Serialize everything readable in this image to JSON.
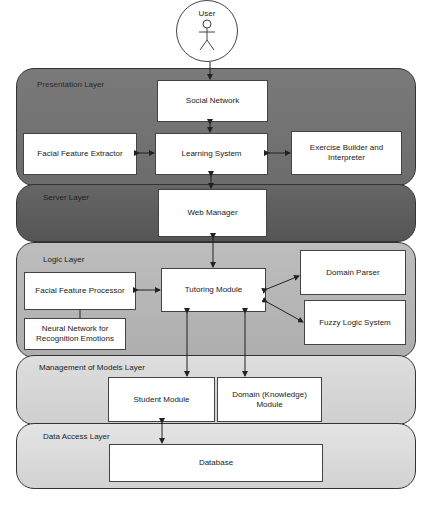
{
  "actor": {
    "label": "User"
  },
  "layers": {
    "presentation": {
      "label": "Presentation Layer",
      "color": "#777777"
    },
    "server": {
      "label": "Server Layer",
      "color": "#5f5f5f"
    },
    "logic": {
      "label": "Logic Layer",
      "color": "#b5b5b5"
    },
    "models": {
      "label": "Management of Models Layer",
      "color": "#d4d4d4"
    },
    "data": {
      "label": "Data Access Layer",
      "color": "#dcdcdc"
    }
  },
  "boxes": {
    "social_network": "Social Network",
    "facial_feature_extractor": "Facial Feature Extractor",
    "learning_system": "Learning System",
    "exercise_builder": "Exercise Builder and Interpreter",
    "web_manager": "Web Manager",
    "facial_feature_processor": "Facial Feature Processor",
    "tutoring_module": "Tutoring Module",
    "domain_parser": "Domain Parser",
    "fuzzy_logic_system": "Fuzzy Logic System",
    "neural_network": "Neural Network for Recognition Emotions",
    "student_module": "Student Module",
    "domain_module": "Domain (Knowledge) Module",
    "database": "Database"
  }
}
